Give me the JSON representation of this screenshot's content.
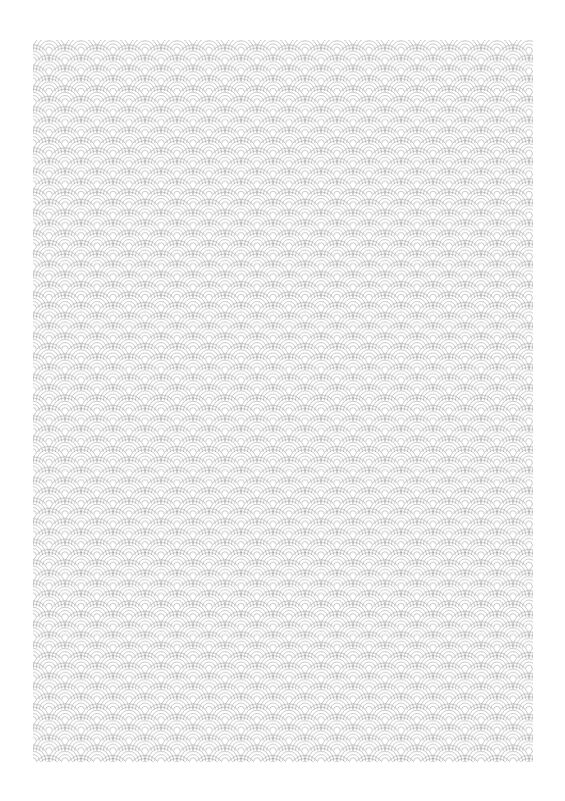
{
  "document": {
    "title": "Seigaiha Wave Pattern Sheet",
    "background_color": "#ffffff",
    "width": 565,
    "height": 801
  },
  "pattern_panel": {
    "name": "seigaiha-wave-pattern",
    "x": 33,
    "y": 40,
    "width": 500,
    "height": 722,
    "background_color": "#ffffff"
  },
  "pattern": {
    "style": "seigaiha",
    "description": "Repeating Japanese seigaiha (blue ocean wave) motif of overlapping concentric semicircular arcs",
    "stroke_color": "#9a9a9a",
    "stroke_width": 0.55,
    "fill_color": "none",
    "scallop_radius": 16,
    "horizontal_period": 32,
    "row_step": 10.3,
    "tile_width": 32,
    "tile_height": 20.6,
    "rings_per_scallop": 5,
    "ring_radii": [
      16,
      12.8,
      9.6,
      6.4,
      3.2
    ],
    "row_offset": 16,
    "columns": 16,
    "rows": 71
  }
}
